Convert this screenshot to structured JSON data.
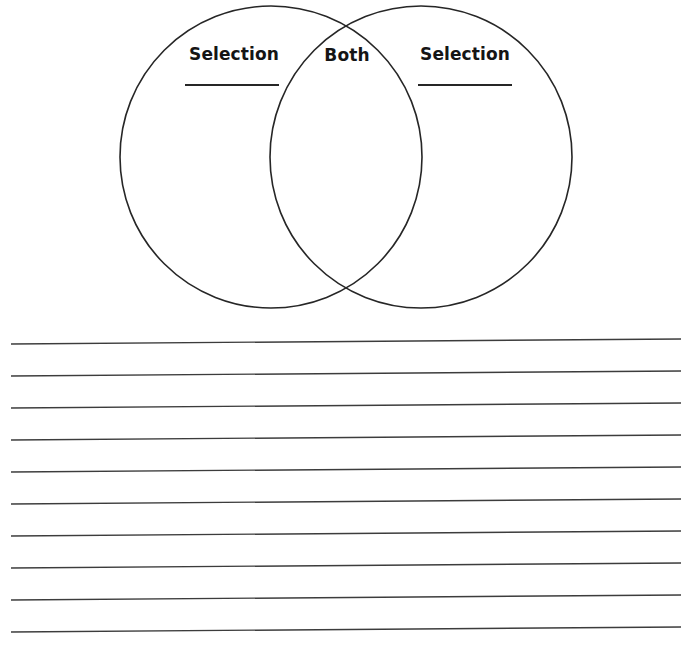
{
  "worksheet": {
    "type": "venn-diagram-worksheet",
    "background_color": "#ffffff",
    "stroke_color": "#262626",
    "text_color": "#151515"
  },
  "venn": {
    "left_circle": {
      "label": "Selection",
      "has_underline": true,
      "cx": 271,
      "cy": 157,
      "r": 151
    },
    "right_circle": {
      "label": "Selection",
      "has_underline": true,
      "cx": 421,
      "cy": 157,
      "r": 151
    },
    "intersection": {
      "label": "Both",
      "has_underline": false
    }
  },
  "ruled_lines": {
    "count": 10,
    "first_y": 19,
    "spacing": 32,
    "x_start": 11,
    "x_end": 681,
    "tilt_px": -5,
    "color": "#3c3c3c"
  }
}
